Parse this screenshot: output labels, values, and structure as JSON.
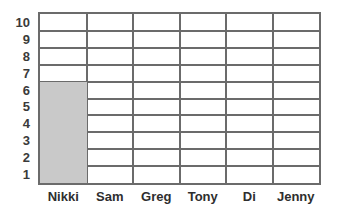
{
  "chart_data": {
    "type": "bar",
    "title": "",
    "subtitle": "",
    "xlabel": "",
    "ylabel": "",
    "categories": [
      "Nikki",
      "Sam",
      "Greg",
      "Tony",
      "Di",
      "Jenny"
    ],
    "values": [
      6,
      0,
      0,
      0,
      0,
      0
    ],
    "series": [
      {
        "name": "",
        "values": [
          6,
          0,
          0,
          0,
          0,
          0
        ]
      }
    ],
    "ylim": [
      0,
      10
    ],
    "ytick_labels": [
      "10",
      "9",
      "8",
      "7",
      "6",
      "5",
      "4",
      "3",
      "2",
      "1"
    ],
    "ytick_values": [
      10,
      9,
      8,
      7,
      6,
      5,
      4,
      3,
      2,
      1
    ],
    "grid": true,
    "grid_rows": 10,
    "grid_columns": 6,
    "legend": false,
    "legend_position": "none",
    "annotations": [],
    "colors": {
      "bar_fill": "#c9c9c9",
      "grid_line": "#6b6b6b",
      "border": "#6b6b6b",
      "plot_background": "#ffffff",
      "tick_label": "#3a3a3a",
      "category_label": "#2e2e2e",
      "page_background": "#ffffff"
    }
  }
}
